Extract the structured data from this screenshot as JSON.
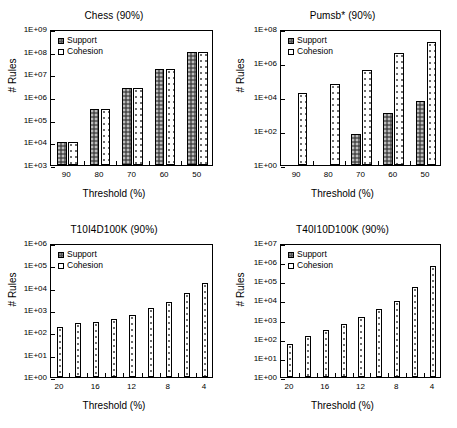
{
  "figure": {
    "series_names": [
      "Support",
      "Cohesion"
    ],
    "y_axis_label": "# Rules",
    "x_axis_label": "Threshold (%)",
    "colors": {
      "support_fill": "#6e6e6e",
      "cohesion_fill": "#ffffff",
      "axis": "#000000",
      "background": "#ffffff"
    }
  },
  "chart_data": [
    {
      "type": "bar",
      "id": "chess",
      "title": "Chess (90%)",
      "xlabel": "Threshold (%)",
      "ylabel": "# Rules",
      "yscale": "log",
      "ylim": [
        1000,
        1000000000
      ],
      "yticks": [
        "1E+03",
        "1E+04",
        "1E+05",
        "1E+06",
        "1E+07",
        "1E+08",
        "1E+09"
      ],
      "ytick_values": [
        1000,
        10000,
        100000,
        1000000,
        10000000,
        100000000,
        1000000000
      ],
      "categories": [
        "90",
        "80",
        "70",
        "60",
        "50"
      ],
      "xticklabels": [
        "90",
        "80",
        "70",
        "60",
        "50"
      ],
      "grid": false,
      "legend_position": "upper left",
      "series": [
        {
          "name": "Support",
          "values": [
            10000,
            300000,
            2500000,
            17000000,
            100000000
          ]
        },
        {
          "name": "Cohesion",
          "values": [
            10000,
            300000,
            2500000,
            17000000,
            100000000
          ]
        }
      ]
    },
    {
      "type": "bar",
      "id": "pumsb-star",
      "title": "Pumsb* (90%)",
      "xlabel": "Threshold (%)",
      "ylabel": "# Rules",
      "yscale": "log",
      "ylim": [
        1,
        100000000
      ],
      "yticks": [
        "1E+00",
        "1E+02",
        "1E+04",
        "1E+06",
        "1E+08"
      ],
      "ytick_values": [
        1,
        100,
        10000,
        1000000,
        100000000
      ],
      "categories": [
        "90",
        "80",
        "70",
        "60",
        "50"
      ],
      "xticklabels": [
        "90",
        "80",
        "70",
        "60",
        "50"
      ],
      "grid": false,
      "legend_position": "upper left",
      "series": [
        {
          "name": "Support",
          "values": [
            null,
            null,
            70,
            1200,
            6000
          ]
        },
        {
          "name": "Cohesion",
          "values": [
            17000,
            58000,
            370000,
            4000000,
            18000000
          ]
        }
      ]
    },
    {
      "type": "bar",
      "id": "t10i4d100k",
      "title": "T10I4D100K (90%)",
      "xlabel": "Threshold (%)",
      "ylabel": "# Rules",
      "yscale": "log",
      "ylim": [
        1,
        1000000
      ],
      "yticks": [
        "1E+00",
        "1E+01",
        "1E+02",
        "1E+03",
        "1E+04",
        "1E+05",
        "1E+06"
      ],
      "ytick_values": [
        1,
        10,
        100,
        1000,
        10000,
        100000,
        1000000
      ],
      "categories": [
        "20",
        "18",
        "16",
        "14",
        "12",
        "10",
        "8",
        "6",
        "4"
      ],
      "xticklabels": [
        "20",
        "",
        "16",
        "",
        "12",
        "",
        "8",
        "",
        "4"
      ],
      "grid": false,
      "legend_position": "upper left",
      "series": [
        {
          "name": "Support",
          "values": [
            null,
            null,
            null,
            null,
            null,
            null,
            null,
            null,
            null
          ]
        },
        {
          "name": "Cohesion",
          "values": [
            170,
            250,
            290,
            400,
            600,
            1200,
            2400,
            6000,
            16000,
            50000
          ]
        }
      ]
    },
    {
      "type": "bar",
      "id": "t40i10d100k",
      "title": "T40I10D100K (90%)",
      "xlabel": "Threshold (%)",
      "ylabel": "# Rules",
      "yscale": "log",
      "ylim": [
        1,
        10000000
      ],
      "yticks": [
        "1E+00",
        "1E+01",
        "1E+02",
        "1E+03",
        "1E+04",
        "1E+05",
        "1E+06",
        "1E+07"
      ],
      "ytick_values": [
        1,
        10,
        100,
        1000,
        10000,
        100000,
        1000000,
        10000000
      ],
      "categories": [
        "20",
        "18",
        "16",
        "14",
        "12",
        "10",
        "8",
        "6",
        "4"
      ],
      "xticklabels": [
        "20",
        "",
        "16",
        "",
        "12",
        "",
        "8",
        "",
        "4"
      ],
      "grid": false,
      "legend_position": "upper left",
      "series": [
        {
          "name": "Support",
          "values": [
            null,
            null,
            null,
            null,
            null,
            null,
            null,
            null,
            null
          ]
        },
        {
          "name": "Cohesion",
          "values": [
            55,
            140,
            270,
            620,
            1400,
            3500,
            9500,
            48000,
            600000
          ]
        }
      ]
    }
  ]
}
